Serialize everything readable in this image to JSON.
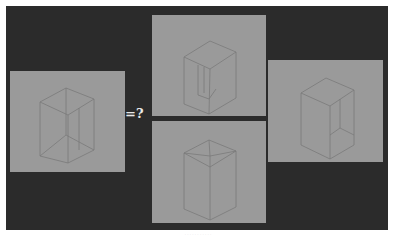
{
  "figure": {
    "question_label": "=?",
    "caption": "· · · · · · · · · · ·",
    "colors": {
      "background": "#2b2b2b",
      "panel": "#9a9a9a",
      "line": "#7a7a7a",
      "text": "#e8e8e8"
    },
    "panels": [
      {
        "id": "left",
        "description": "Wireframe box (ambiguous Necker-style) — the query figure"
      },
      {
        "id": "top-middle",
        "description": "Interpretation: box viewed from above, top face closed"
      },
      {
        "id": "bottom-middle",
        "description": "Interpretation: box viewed with open top / inner corner"
      },
      {
        "id": "right",
        "description": "Interpretation: box with closed top, inner back corner visible"
      }
    ]
  }
}
